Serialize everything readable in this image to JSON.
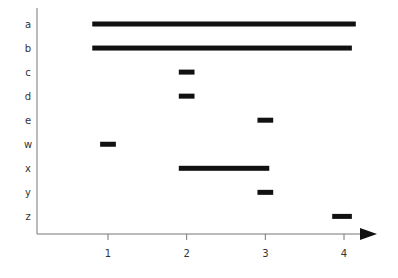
{
  "chart_data": {
    "type": "gantt-range",
    "title": "",
    "xlabel": "",
    "ylabel": "",
    "xlim": [
      0.1,
      4.4
    ],
    "x_ticks": [
      1,
      2,
      3,
      4
    ],
    "grid": false,
    "legend": null,
    "categories": [
      "a",
      "b",
      "c",
      "d",
      "e",
      "w",
      "x",
      "y",
      "z"
    ],
    "ranges": [
      {
        "label": "a",
        "start": 0.8,
        "end": 4.15
      },
      {
        "label": "b",
        "start": 0.8,
        "end": 4.1
      },
      {
        "label": "c",
        "start": 1.9,
        "end": 2.1
      },
      {
        "label": "d",
        "start": 1.9,
        "end": 2.1
      },
      {
        "label": "e",
        "start": 2.9,
        "end": 3.1
      },
      {
        "label": "w",
        "start": 0.9,
        "end": 1.1
      },
      {
        "label": "x",
        "start": 1.9,
        "end": 3.05
      },
      {
        "label": "y",
        "start": 2.9,
        "end": 3.1
      },
      {
        "label": "z",
        "start": 3.85,
        "end": 4.1
      }
    ]
  },
  "style": {
    "bar_color": "#111111",
    "axis_color": "#777777",
    "label_color": "#333333"
  }
}
